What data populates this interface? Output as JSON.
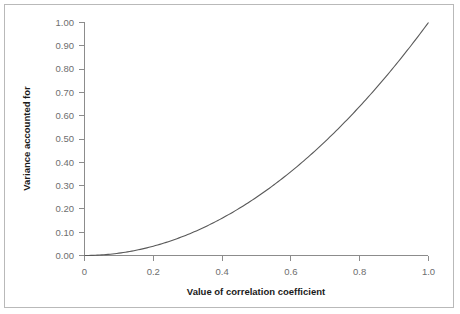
{
  "chart_data": {
    "type": "line",
    "title": "",
    "xlabel": "Value of correlation coefficient",
    "ylabel": "Variance accounted for",
    "xlim": [
      0,
      1.0
    ],
    "ylim": [
      0,
      1.0
    ],
    "grid": false,
    "legend": "none",
    "xticks": [
      "0",
      "0.2",
      "0.4",
      "0.6",
      "0.8",
      "1.0"
    ],
    "xtick_values": [
      0,
      0.2,
      0.4,
      0.6,
      0.8,
      1.0
    ],
    "yticks": [
      "0.00",
      "0.10",
      "0.20",
      "0.30",
      "0.40",
      "0.50",
      "0.60",
      "0.70",
      "0.80",
      "0.90",
      "1.00"
    ],
    "ytick_values": [
      0,
      0.1,
      0.2,
      0.3,
      0.4,
      0.5,
      0.6,
      0.7,
      0.8,
      0.9,
      1.0
    ],
    "series": [
      {
        "name": "Variance accounted for (r squared)",
        "x": [
          0,
          0.05,
          0.1,
          0.15,
          0.2,
          0.25,
          0.3,
          0.35,
          0.4,
          0.45,
          0.5,
          0.55,
          0.6,
          0.65,
          0.7,
          0.75,
          0.8,
          0.85,
          0.9,
          0.95,
          1.0
        ],
        "values": [
          0,
          0.0025,
          0.01,
          0.0225,
          0.04,
          0.0625,
          0.09,
          0.1225,
          0.16,
          0.2025,
          0.25,
          0.3025,
          0.36,
          0.4225,
          0.49,
          0.5625,
          0.64,
          0.7225,
          0.81,
          0.9025,
          1.0
        ]
      }
    ]
  },
  "style": {
    "curve_color": "#595959",
    "axis_color": "#8c8c8c",
    "tick_label_color": "#6e6e6e",
    "axis_title_color": "#1a1a1a",
    "frame_color": "#b9b9b9",
    "background": "#ffffff"
  }
}
